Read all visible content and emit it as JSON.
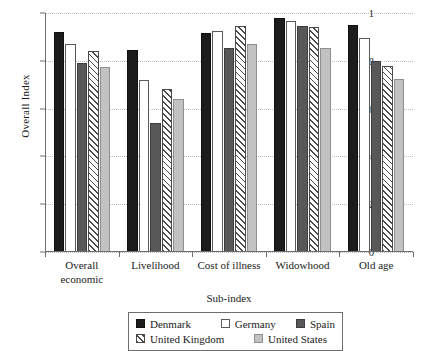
{
  "chart_data": {
    "type": "bar",
    "title": "",
    "xlabel": "Sub-index",
    "ylabel": "Overall Index",
    "ylim": [
      0,
      1
    ],
    "yticks": [
      0,
      0.2,
      0.4,
      0.6,
      0.8,
      1
    ],
    "ytick_labels": [
      "0",
      "0.2",
      "0.4",
      "0.6",
      "0.8",
      "1"
    ],
    "grid": "horizontal-dotted",
    "legend_position": "below-axis",
    "categories": [
      "Overall economic",
      "Livelihood",
      "Cost of illness",
      "Widowhood",
      "Old age"
    ],
    "category_lines": [
      [
        "Overall",
        "economic"
      ],
      [
        "Livelihood"
      ],
      [
        "Cost of illness"
      ],
      [
        "Widowhood"
      ],
      [
        "Old age"
      ]
    ],
    "series": [
      {
        "name": "Denmark",
        "key": "denmark",
        "swatch": "solid-black",
        "color": "#1c1c1c",
        "values": [
          0.92,
          0.845,
          0.915,
          0.98,
          0.95
        ]
      },
      {
        "name": "Germany",
        "key": "germany",
        "swatch": "outline-white",
        "color": "#ffffff",
        "values": [
          0.87,
          0.72,
          0.925,
          0.965,
          0.895
        ]
      },
      {
        "name": "Spain",
        "key": "spain",
        "swatch": "solid-dark-gray",
        "color": "#585858",
        "values": [
          0.79,
          0.54,
          0.855,
          0.945,
          0.8
        ]
      },
      {
        "name": "United Kingdom",
        "key": "united-kingdom",
        "swatch": "diagonal-hatch",
        "color": "#4a4a4a",
        "values": [
          0.84,
          0.68,
          0.945,
          0.94,
          0.78
        ]
      },
      {
        "name": "United States",
        "key": "united-states",
        "swatch": "solid-light-gray",
        "color": "#c2c2c2",
        "values": [
          0.775,
          0.64,
          0.87,
          0.855,
          0.725
        ]
      }
    ]
  }
}
